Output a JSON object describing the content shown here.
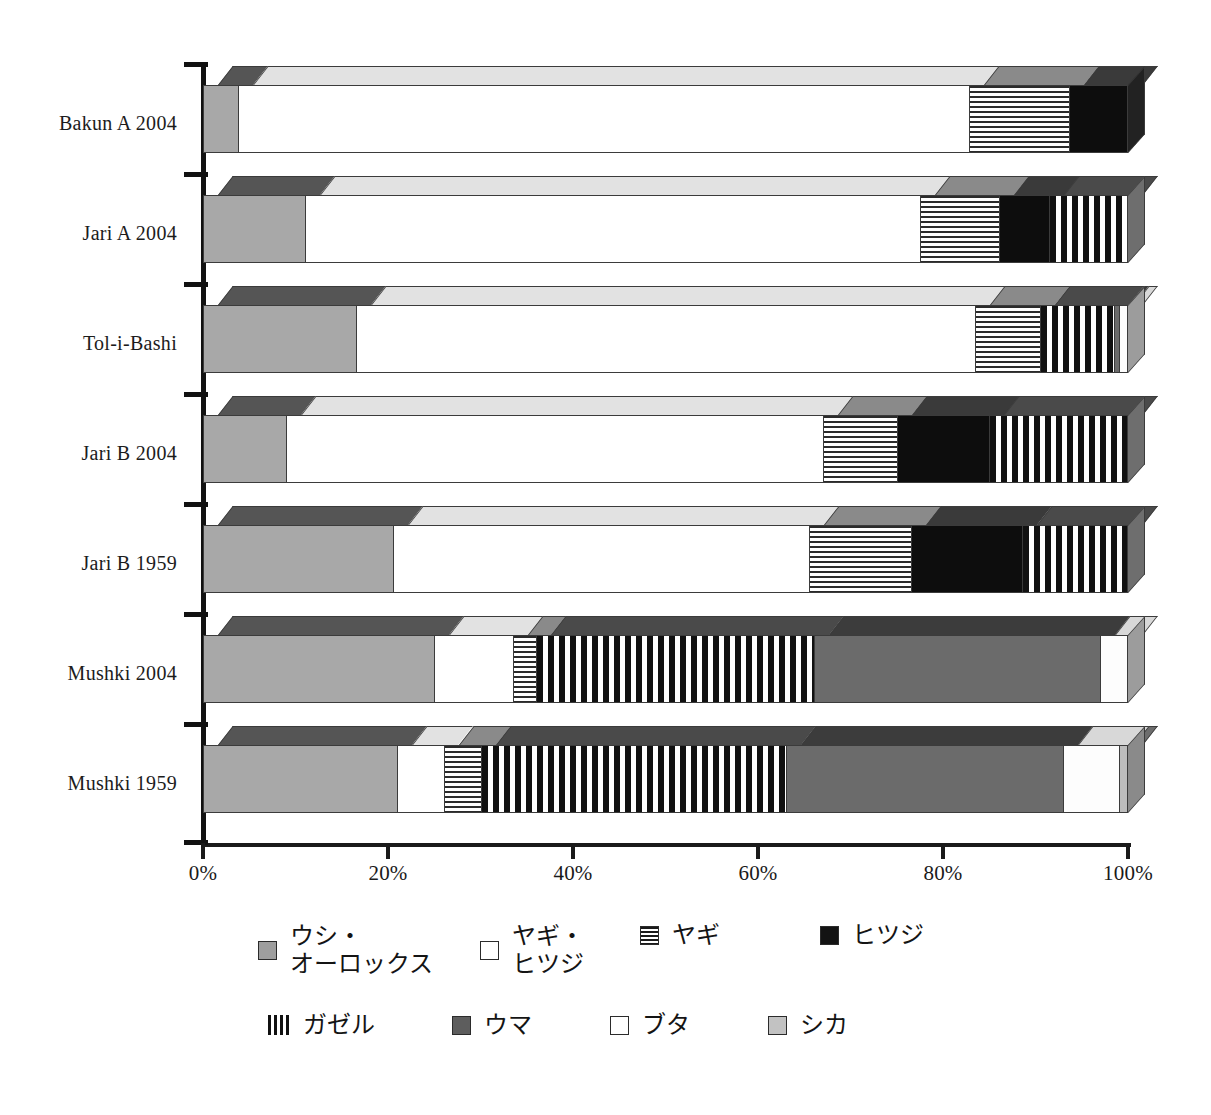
{
  "chart_data": {
    "type": "bar",
    "orientation": "horizontal",
    "stacked": true,
    "percent": true,
    "title": "",
    "xlabel": "",
    "ylabel": "",
    "xlim": [
      0,
      100
    ],
    "grid": false,
    "legend_position": "bottom",
    "x_tick_labels": [
      "0%",
      "20%",
      "40%",
      "60%",
      "80%",
      "100%"
    ],
    "x_ticks": [
      0,
      20,
      40,
      60,
      80,
      100
    ],
    "categories": [
      "Bakun A  2004",
      "Jari A 2004",
      "Tol-i-Bashi",
      "Jari B 2004",
      "Jari B 1959",
      "Mushki  2004",
      "Mushki  1959"
    ],
    "series": [
      {
        "name": "ウシ・\nオーロックス",
        "key": "cattle",
        "fill": "gray",
        "values": [
          3.8,
          11.0,
          16.5,
          9.0,
          20.5,
          25.0,
          21.0
        ]
      },
      {
        "name": "ヤギ・\nヒツジ",
        "key": "sheepgoat",
        "fill": "white",
        "values": [
          79.0,
          66.5,
          67.0,
          58.0,
          45.0,
          8.5,
          5.0
        ]
      },
      {
        "name": "ヤギ",
        "key": "goat",
        "fill": "hstripe",
        "values": [
          10.8,
          8.5,
          7.0,
          8.0,
          11.0,
          2.5,
          4.0
        ]
      },
      {
        "name": "ヒツジ",
        "key": "sheep",
        "fill": "black",
        "values": [
          6.4,
          5.5,
          0.0,
          10.0,
          12.0,
          0.0,
          0.0
        ]
      },
      {
        "name": "ガゼル",
        "key": "gazelle",
        "fill": "vstripe",
        "values": [
          0.0,
          8.5,
          8.0,
          15.0,
          11.5,
          30.0,
          33.0
        ]
      },
      {
        "name": "ウマ",
        "key": "horse",
        "fill": "horse",
        "values": [
          0.0,
          0.0,
          0.5,
          0.0,
          0.0,
          31.0,
          30.0
        ]
      },
      {
        "name": "ブタ",
        "key": "pig",
        "fill": "pig",
        "values": [
          0.0,
          0.0,
          1.0,
          0.0,
          0.0,
          3.0,
          6.0
        ]
      },
      {
        "name": "シカ",
        "key": "deer",
        "fill": "deer",
        "values": [
          0.0,
          0.0,
          0.0,
          0.0,
          0.0,
          0.0,
          1.0
        ]
      }
    ]
  },
  "legend": {
    "row1": [
      {
        "label": "ウシ・\nオーロックス",
        "swatch": "gray"
      },
      {
        "label": "ヤギ・\nヒツジ",
        "swatch": "white"
      },
      {
        "label": "ヤギ",
        "swatch": "hstripe"
      },
      {
        "label": "ヒツジ",
        "swatch": "black"
      }
    ],
    "row2": [
      {
        "label": "ガゼル",
        "swatch": "vstripe"
      },
      {
        "label": "ウマ",
        "swatch": "horse"
      },
      {
        "label": "ブタ",
        "swatch": "pig"
      },
      {
        "label": "シカ",
        "swatch": "deer"
      }
    ]
  },
  "colors": {
    "cattle": "#a8a8a8",
    "sheepgoat": "#ffffff",
    "goat_stripe": "#2b2b2b",
    "sheep": "#0d0d0d",
    "gazelle_stripe": "#111111",
    "horse": "#6b6b6b",
    "pig": "#fdfdfd",
    "deer": "#bdbdbd",
    "axis": "#111111"
  }
}
